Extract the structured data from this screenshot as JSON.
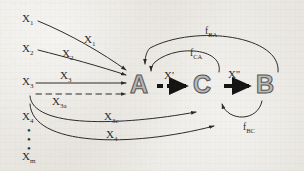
{
  "diagram": {
    "background_color": "#e8e6e1",
    "ink_color": "#2b2b2b",
    "node_outline_color": "#555555",
    "nodes": [
      {
        "id": "A",
        "label": "A",
        "x": 140,
        "y": 84
      },
      {
        "id": "C",
        "label": "C",
        "x": 206,
        "y": 84
      },
      {
        "id": "B",
        "label": "B",
        "x": 268,
        "y": 84
      }
    ],
    "inputs": [
      {
        "label": "X",
        "sub": "1"
      },
      {
        "label": "X",
        "sub": "2"
      },
      {
        "label": "X",
        "sub": "3"
      },
      {
        "label": "X",
        "sub": "4"
      },
      {
        "label": "X",
        "sub": "m"
      }
    ],
    "arrow_labels": [
      {
        "label": "X",
        "sub": "1",
        "kind": "solid"
      },
      {
        "label": "X",
        "sub": "2",
        "kind": "solid"
      },
      {
        "label": "X",
        "sub": "3",
        "kind": "solid"
      },
      {
        "label": "X",
        "sub": "3a",
        "kind": "dashed"
      },
      {
        "label": "X",
        "sub": "3c",
        "kind": "curve"
      },
      {
        "label": "X",
        "sub": "4",
        "kind": "curve"
      }
    ],
    "transfer_labels": [
      {
        "label": "X",
        "prime": "'",
        "from": "A",
        "to": "C"
      },
      {
        "label": "X",
        "prime": "''",
        "from": "C",
        "to": "B"
      }
    ],
    "feedback_labels": [
      {
        "label": "f",
        "sub": "BA",
        "from": "B",
        "to": "A"
      },
      {
        "label": "f",
        "sub": "CA",
        "from": "C",
        "to": "A"
      },
      {
        "label": "f",
        "sub": "BC",
        "from": "B",
        "to": "C"
      }
    ],
    "ellipsis": "•"
  }
}
